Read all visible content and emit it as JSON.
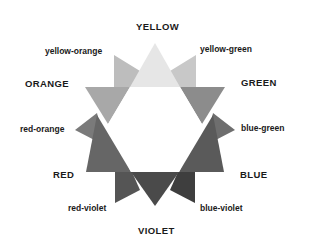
{
  "labels": {
    "yellow": "YELLOW",
    "yellow_orange": "yellow-orange",
    "yellow_green": "yellow-green",
    "orange": "ORANGE",
    "green": "GREEN",
    "red_orange": "red-orange",
    "blue_green": "blue-green",
    "red": "RED",
    "blue": "BLUE",
    "red_violet": "red-violet",
    "blue_violet": "blue-violet",
    "violet": "VIOLET"
  },
  "colors": {
    "yellow": "#e6e6e6",
    "yellow_orange": "#bdbdbd",
    "yellow_green": "#c8c8c8",
    "orange": "#a8a8a8",
    "green": "#8c8c8c",
    "red_orange": "#7a7a7a",
    "blue_green": "#6e6e6e",
    "red": "#666666",
    "blue": "#5a5a5a",
    "red_violet": "#555555",
    "blue_violet": "#3e3e3e",
    "violet": "#4a4a4a"
  }
}
